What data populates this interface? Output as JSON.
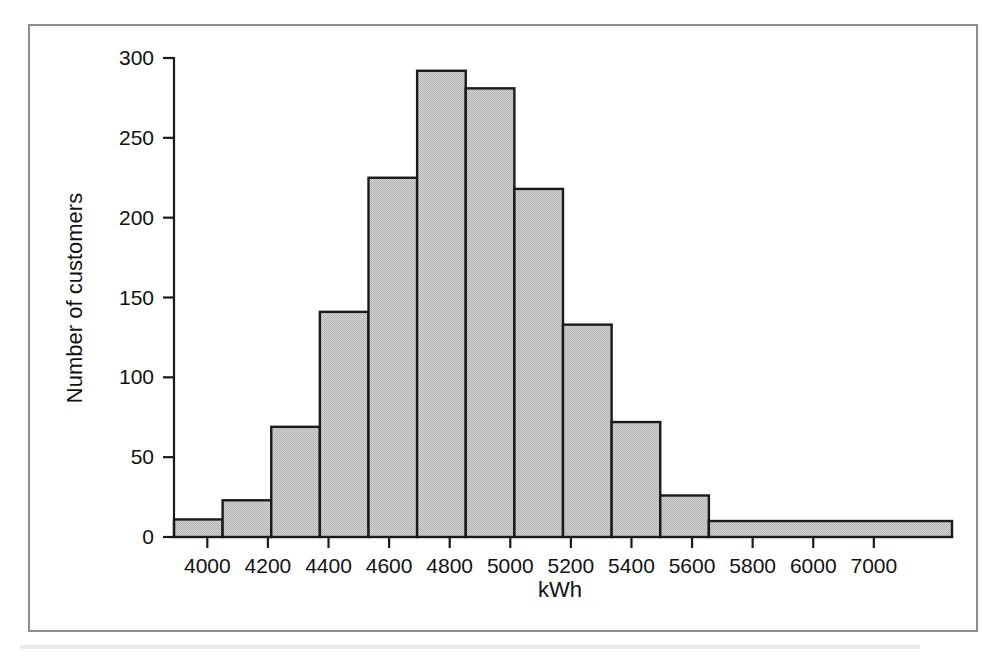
{
  "figure": {
    "border_color": "#8d8d8d",
    "background": "#ffffff"
  },
  "chart_data": {
    "type": "bar",
    "title": "",
    "subtitle": "",
    "xlabel": "kWh",
    "ylabel": "Number of customers",
    "grid": false,
    "legend": null,
    "legend_position": "none",
    "bar_fill_color": "#c8c8c8",
    "bar_edge_color": "#1a1a1a",
    "bin_width": 200,
    "bin_edges": [
      3900,
      4100,
      4300,
      4500,
      4700,
      4900,
      5100,
      5300,
      5500,
      5700,
      5900,
      6100,
      7100
    ],
    "categories": [
      "3900-4100",
      "4100-4300",
      "4300-4500",
      "4500-4700",
      "4700-4900",
      "4900-5100",
      "5100-5300",
      "5300-5500",
      "5500-5700",
      "5700-5900",
      "5900-6100",
      "6100-7100"
    ],
    "values": [
      11,
      23,
      69,
      141,
      225,
      292,
      281,
      218,
      133,
      72,
      26,
      10
    ],
    "xlim": [
      3900,
      7100
    ],
    "ylim": [
      0,
      300
    ],
    "xticks": [
      4000,
      4200,
      4400,
      4600,
      4800,
      5000,
      5200,
      5400,
      5600,
      5800,
      6000,
      7000
    ],
    "xtick_labels": [
      "4000",
      "4200",
      "4400",
      "4600",
      "4800",
      "5000",
      "5200",
      "5400",
      "5600",
      "5800",
      "6000",
      "7000"
    ],
    "yticks": [
      0,
      50,
      100,
      150,
      200,
      250,
      300
    ],
    "ytick_labels": [
      "0",
      "50",
      "100",
      "150",
      "200",
      "250",
      "300"
    ]
  }
}
